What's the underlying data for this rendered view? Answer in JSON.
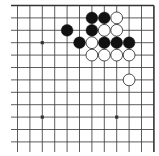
{
  "diagram": {
    "type": "go-board-corner",
    "region": "top-right corner of 19x19 board",
    "visible_columns": 12,
    "visible_rows": 12,
    "edges": [
      "top",
      "right"
    ],
    "colors": {
      "background": "#ffffff",
      "line": "#333333",
      "black_stone": "#111111",
      "white_stone_fill": "#ffffff",
      "white_stone_stroke": "#222222"
    },
    "star_points": [
      {
        "col": 2,
        "row": 3
      },
      {
        "col": 8,
        "row": 9
      },
      {
        "col": 2,
        "row": 9
      }
    ],
    "stones": [
      {
        "color": "black",
        "col": 6,
        "row": 1
      },
      {
        "color": "black",
        "col": 7,
        "row": 1
      },
      {
        "color": "white",
        "col": 8,
        "row": 1
      },
      {
        "color": "black",
        "col": 4,
        "row": 2
      },
      {
        "color": "black",
        "col": 6,
        "row": 2
      },
      {
        "color": "white",
        "col": 7,
        "row": 2
      },
      {
        "color": "white",
        "col": 8,
        "row": 2
      },
      {
        "color": "black",
        "col": 5,
        "row": 3
      },
      {
        "color": "white",
        "col": 6,
        "row": 3
      },
      {
        "color": "black",
        "col": 7,
        "row": 3
      },
      {
        "color": "black",
        "col": 8,
        "row": 3
      },
      {
        "color": "black",
        "col": 9,
        "row": 3
      },
      {
        "color": "white",
        "col": 6,
        "row": 4
      },
      {
        "color": "white",
        "col": 7,
        "row": 4
      },
      {
        "color": "white",
        "col": 8,
        "row": 4
      },
      {
        "color": "white",
        "col": 9,
        "row": 4
      },
      {
        "color": "white",
        "col": 9,
        "row": 6
      }
    ]
  }
}
